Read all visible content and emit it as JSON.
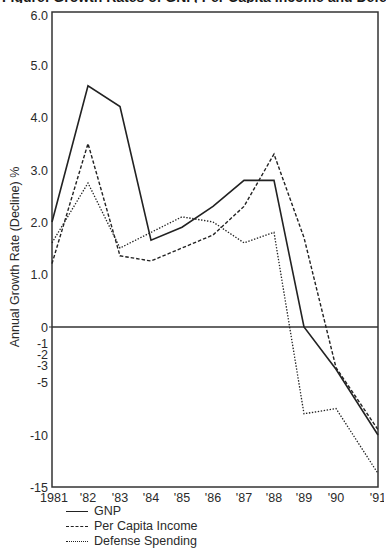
{
  "title_clipped": "Figure: Growth Rates of GNP, Per Capita Income and Defense Spending, 1981-1991",
  "chart_data": {
    "type": "line",
    "title": "",
    "xlabel": "",
    "ylabel": "Annual Growth Rate (Decline) %",
    "x": [
      "1981",
      "'82",
      "'83",
      "'84",
      "'85",
      "'86",
      "'87",
      "'88",
      "'89",
      "'90",
      "'91"
    ],
    "y_ticks": [
      "6.0",
      "5.0",
      "4.0",
      "3.0",
      "2.0",
      "1.0",
      "0",
      "-1",
      "-2",
      "-3",
      "-5",
      "-10",
      "-15"
    ],
    "y_tick_values": [
      6,
      5,
      4,
      3,
      2,
      1,
      0,
      -1,
      -2,
      -3,
      -5,
      -10,
      -15
    ],
    "ylim": [
      -15,
      6
    ],
    "y_scale_note": "non-linear: compressed below zero",
    "grid": false,
    "zero_line": true,
    "legend_position": "bottom-left",
    "series": [
      {
        "name": "GNP",
        "style": "solid",
        "values": [
          2.0,
          4.6,
          4.2,
          1.65,
          1.9,
          2.3,
          2.8,
          2.8,
          0.0,
          -3.5,
          -10.0
        ]
      },
      {
        "name": "Per Capita Income",
        "style": "dashed",
        "values": [
          1.2,
          3.5,
          1.35,
          1.25,
          1.5,
          1.75,
          2.3,
          3.3,
          1.7,
          -3.3,
          -9.5
        ]
      },
      {
        "name": "Defense Spending",
        "style": "dotted",
        "values": [
          1.6,
          2.75,
          1.5,
          1.8,
          2.1,
          2.0,
          1.6,
          1.8,
          -8.0,
          -7.5,
          -13.7
        ]
      }
    ]
  },
  "legend": {
    "items": [
      {
        "label": "GNP",
        "style": "solid"
      },
      {
        "label": "Per Capita Income",
        "style": "dashed"
      },
      {
        "label": "Defense Spending",
        "style": "dotted"
      }
    ]
  },
  "colors": {
    "line": "#222222",
    "axis": "#333333",
    "text": "#2a2a2a",
    "background": "#ffffff"
  }
}
